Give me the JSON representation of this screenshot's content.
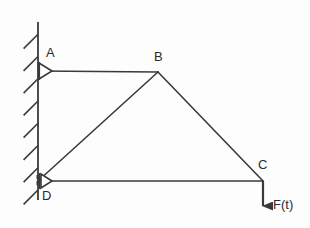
{
  "diagram": {
    "type": "structural-free-body-diagram",
    "canvas": {
      "width": 310,
      "height": 228,
      "background": "#fdfdfd"
    },
    "stroke": {
      "color": "#3a3a3a",
      "width": 1.6,
      "hatch_color": "#3a3a3a"
    }
  },
  "wall": {
    "name": "fixed-wall",
    "x": 38,
    "y_top": 22,
    "y_bottom": 200,
    "hatch_count": 8,
    "hatch_length": 20,
    "hatch_angle_deg": 45,
    "hatch_side": "left"
  },
  "nodes": [
    {
      "id": "A",
      "label": "A",
      "x": 38,
      "y": 71,
      "label_x": 46,
      "label_y": 46,
      "support": "pin"
    },
    {
      "id": "B",
      "label": "B",
      "x": 158,
      "y": 72,
      "label_x": 154,
      "label_y": 50,
      "support": "none"
    },
    {
      "id": "C",
      "label": "C",
      "x": 263,
      "y": 181,
      "label_x": 258,
      "label_y": 158,
      "support": "none"
    },
    {
      "id": "D",
      "label": "D",
      "x": 38,
      "y": 181,
      "label_x": 42,
      "label_y": 189,
      "support": "roller"
    }
  ],
  "members": [
    {
      "name": "member-AB",
      "from": "A",
      "to": "B"
    },
    {
      "name": "member-BC",
      "from": "B",
      "to": "C"
    },
    {
      "name": "member-BD",
      "from": "B",
      "to": "D"
    },
    {
      "name": "member-DC",
      "from": "D",
      "to": "C"
    }
  ],
  "supports": {
    "A": {
      "name": "pin-support-A",
      "shape": "triangle-right",
      "apex_x": 52,
      "top_y": 63,
      "bottom_y": 79,
      "base_x": 39
    },
    "D": {
      "name": "roller-support-D",
      "shape": "triangle-right-with-rollers",
      "apex_x": 52,
      "top_y": 174,
      "bottom_y": 188,
      "base_x": 41,
      "roller_marks": 2
    }
  },
  "force": {
    "name": "applied-force-F",
    "label": "F(t)",
    "label_x": 273,
    "label_y": 198,
    "arrow_from_x": 263,
    "arrow_from_y": 181,
    "arrow_to_x": 263,
    "arrow_to_y": 216,
    "direction": "down"
  }
}
